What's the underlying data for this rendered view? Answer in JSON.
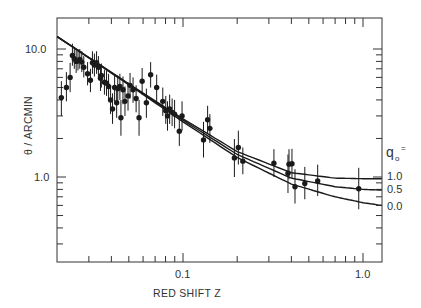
{
  "chart_data": {
    "type": "scatter",
    "title": "",
    "xlabel": "RED SHIFT Z",
    "ylabel": "θ / ARCMIN",
    "xscale": "log",
    "yscale": "log",
    "xlim": [
      0.02,
      1.27
    ],
    "ylim": [
      0.21,
      13.2
    ],
    "x_ticks": [
      {
        "value": 0.1,
        "label": "0.1"
      },
      {
        "value": 1.0,
        "label": "1.0"
      }
    ],
    "y_ticks": [
      {
        "value": 10.0,
        "label": "10.0"
      },
      {
        "value": 1.0,
        "label": "1.0"
      }
    ],
    "grid": false,
    "legend": {
      "title": "q0 =",
      "position": "right-outside",
      "entries": [
        "1.0",
        "0.5",
        "0.0"
      ]
    },
    "series": [
      {
        "name": "observed",
        "kind": "points-with-errorbars",
        "points": [
          {
            "z": 0.0211,
            "theta": 4.17,
            "lo": 3.0,
            "hi": 5.6
          },
          {
            "z": 0.0225,
            "theta": 5.0,
            "lo": 3.9,
            "hi": 6.6
          },
          {
            "z": 0.0236,
            "theta": 6.0,
            "lo": 4.6,
            "hi": 7.8
          },
          {
            "z": 0.0243,
            "theta": 8.9,
            "lo": 7.4,
            "hi": 11.0
          },
          {
            "z": 0.0249,
            "theta": 8.4,
            "lo": 7.0,
            "hi": 10.4
          },
          {
            "z": 0.0255,
            "theta": 8.0,
            "lo": 6.5,
            "hi": 9.8
          },
          {
            "z": 0.0261,
            "theta": 8.1,
            "lo": 6.8,
            "hi": 9.9
          },
          {
            "z": 0.0267,
            "theta": 8.3,
            "lo": 7.0,
            "hi": 10.0
          },
          {
            "z": 0.0274,
            "theta": 7.9,
            "lo": 6.6,
            "hi": 9.6
          },
          {
            "z": 0.0281,
            "theta": 7.2,
            "lo": 6.0,
            "hi": 8.8
          },
          {
            "z": 0.0295,
            "theta": 6.4,
            "lo": 5.2,
            "hi": 7.9
          },
          {
            "z": 0.0306,
            "theta": 5.7,
            "lo": 4.6,
            "hi": 7.0
          },
          {
            "z": 0.0314,
            "theta": 7.8,
            "lo": 6.4,
            "hi": 9.6
          },
          {
            "z": 0.0322,
            "theta": 7.5,
            "lo": 6.1,
            "hi": 9.2
          },
          {
            "z": 0.0331,
            "theta": 7.8,
            "lo": 6.4,
            "hi": 9.6
          },
          {
            "z": 0.0339,
            "theta": 7.2,
            "lo": 5.9,
            "hi": 8.8
          },
          {
            "z": 0.0348,
            "theta": 5.9,
            "lo": 4.7,
            "hi": 7.4
          },
          {
            "z": 0.0352,
            "theta": 6.2,
            "lo": 5.0,
            "hi": 7.7
          },
          {
            "z": 0.0366,
            "theta": 5.5,
            "lo": 4.4,
            "hi": 6.9
          },
          {
            "z": 0.0376,
            "theta": 5.4,
            "lo": 4.3,
            "hi": 6.8
          },
          {
            "z": 0.0386,
            "theta": 5.1,
            "lo": 4.0,
            "hi": 6.4
          },
          {
            "z": 0.0396,
            "theta": 4.0,
            "lo": 3.1,
            "hi": 5.2
          },
          {
            "z": 0.0406,
            "theta": 3.4,
            "lo": 2.6,
            "hi": 4.5
          },
          {
            "z": 0.0417,
            "theta": 5.0,
            "lo": 3.9,
            "hi": 6.3
          },
          {
            "z": 0.0428,
            "theta": 3.8,
            "lo": 2.9,
            "hi": 5.0
          },
          {
            "z": 0.0434,
            "theta": 4.9,
            "lo": 3.8,
            "hi": 6.2
          },
          {
            "z": 0.0446,
            "theta": 5.1,
            "lo": 4.0,
            "hi": 6.4
          },
          {
            "z": 0.0452,
            "theta": 2.9,
            "lo": 2.1,
            "hi": 4.0
          },
          {
            "z": 0.0464,
            "theta": 4.8,
            "lo": 3.7,
            "hi": 6.1
          },
          {
            "z": 0.0476,
            "theta": 3.9,
            "lo": 3.0,
            "hi": 5.1
          },
          {
            "z": 0.0495,
            "theta": 4.3,
            "lo": 3.3,
            "hi": 5.5
          },
          {
            "z": 0.0508,
            "theta": 5.2,
            "lo": 4.1,
            "hi": 6.5
          },
          {
            "z": 0.0528,
            "theta": 4.8,
            "lo": 3.8,
            "hi": 6.0
          },
          {
            "z": 0.0549,
            "theta": 4.1,
            "lo": 3.2,
            "hi": 5.2
          },
          {
            "z": 0.057,
            "theta": 2.9,
            "lo": 2.1,
            "hi": 4.0
          },
          {
            "z": 0.0593,
            "theta": 5.6,
            "lo": 4.4,
            "hi": 7.1
          },
          {
            "z": 0.0626,
            "theta": 3.8,
            "lo": 2.9,
            "hi": 4.9
          },
          {
            "z": 0.0661,
            "theta": 6.3,
            "lo": 5.0,
            "hi": 7.9
          },
          {
            "z": 0.0714,
            "theta": 5.0,
            "lo": 3.9,
            "hi": 6.3
          },
          {
            "z": 0.0772,
            "theta": 3.9,
            "lo": 3.0,
            "hi": 5.0
          },
          {
            "z": 0.0802,
            "theta": 3.3,
            "lo": 2.6,
            "hi": 4.3
          },
          {
            "z": 0.082,
            "theta": 3.0,
            "lo": 2.3,
            "hi": 3.9
          },
          {
            "z": 0.0843,
            "theta": 3.4,
            "lo": 2.6,
            "hi": 4.4
          },
          {
            "z": 0.087,
            "theta": 3.2,
            "lo": 2.5,
            "hi": 4.1
          },
          {
            "z": 0.0898,
            "theta": 3.1,
            "lo": 2.4,
            "hi": 4.0
          },
          {
            "z": 0.0954,
            "theta": 2.28,
            "lo": 1.75,
            "hi": 2.95
          },
          {
            "z": 0.0988,
            "theta": 3.0,
            "lo": 2.3,
            "hi": 3.9
          },
          {
            "z": 0.13,
            "theta": 1.95,
            "lo": 1.42,
            "hi": 2.7
          },
          {
            "z": 0.137,
            "theta": 2.8,
            "lo": 2.2,
            "hi": 3.6
          },
          {
            "z": 0.141,
            "theta": 2.4,
            "lo": 1.85,
            "hi": 3.1
          },
          {
            "z": 0.193,
            "theta": 1.41,
            "lo": 1.0,
            "hi": 1.98
          },
          {
            "z": 0.203,
            "theta": 1.7,
            "lo": 1.25,
            "hi": 2.3
          },
          {
            "z": 0.215,
            "theta": 1.33,
            "lo": 1.05,
            "hi": 1.7
          },
          {
            "z": 0.32,
            "theta": 1.28,
            "lo": 1.0,
            "hi": 1.65
          },
          {
            "z": 0.383,
            "theta": 1.07,
            "lo": 0.75,
            "hi": 1.5
          },
          {
            "z": 0.388,
            "theta": 1.26,
            "lo": 0.96,
            "hi": 1.65
          },
          {
            "z": 0.403,
            "theta": 1.27,
            "lo": 0.97,
            "hi": 1.66
          },
          {
            "z": 0.419,
            "theta": 0.84,
            "lo": 0.62,
            "hi": 1.15
          },
          {
            "z": 0.475,
            "theta": 0.89,
            "lo": 0.67,
            "hi": 1.2
          },
          {
            "z": 0.56,
            "theta": 0.93,
            "lo": 0.71,
            "hi": 1.25
          },
          {
            "z": 0.947,
            "theta": 0.81,
            "lo": 0.56,
            "hi": 1.18
          }
        ]
      },
      {
        "name": "q0 = 1.0",
        "kind": "line",
        "x": [
          0.02,
          0.05,
          0.1,
          0.2,
          0.4,
          0.7,
          1.0,
          1.27
        ],
        "y": [
          12.5,
          5.35,
          2.85,
          1.58,
          1.08,
          0.98,
          0.97,
          0.97
        ]
      },
      {
        "name": "q0 = 0.5",
        "kind": "line",
        "x": [
          0.02,
          0.05,
          0.1,
          0.2,
          0.4,
          0.7,
          1.0,
          1.27
        ],
        "y": [
          12.5,
          5.3,
          2.78,
          1.5,
          0.98,
          0.84,
          0.8,
          0.79
        ]
      },
      {
        "name": "q0 = 0.0",
        "kind": "line",
        "x": [
          0.02,
          0.05,
          0.1,
          0.2,
          0.4,
          0.7,
          1.0,
          1.27
        ],
        "y": [
          12.5,
          5.25,
          2.7,
          1.42,
          0.88,
          0.7,
          0.63,
          0.6
        ]
      }
    ]
  },
  "axes": {
    "x_title": "RED SHIFT Z",
    "y_title": "θ / ARCMIN",
    "x_tick_01": "0.1",
    "x_tick_10": "1.0",
    "y_tick_10": "10.0",
    "y_tick_1": "1.0"
  },
  "legend": {
    "title_q": "q",
    "title_sub": "o",
    "title_eq": "=",
    "labels": [
      "1.0",
      "0.5",
      "0.0"
    ]
  },
  "colors": {
    "ink": "#1a1a1a",
    "frame": "#333333",
    "background": "#ffffff"
  }
}
